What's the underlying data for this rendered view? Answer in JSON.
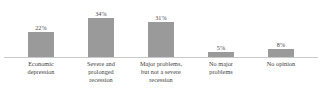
{
  "chart_data": {
    "type": "bar",
    "title": "",
    "subtitle": "",
    "xlabel": "",
    "ylabel": "",
    "ylim": [
      0,
      40
    ],
    "grid": false,
    "legend": false,
    "orientation": "vertical",
    "value_suffix": "%",
    "bar_color": "#9a9a9a",
    "axis_color": "#c9c9c9",
    "label_color": "#3c3c3c",
    "value_label_color": "#4a4a4a",
    "background_color": "#ffffff",
    "categories": [
      "Economic depression",
      "Severe and prolonged recession",
      "Major problems, but not a severe recession",
      "No major problems",
      "No opinion"
    ],
    "category_lines": [
      [
        "Economic",
        "depression"
      ],
      [
        "Severe and",
        "prolonged",
        "recession"
      ],
      [
        "Major problems,",
        "but not a severe",
        "recession"
      ],
      [
        "No major",
        "problems"
      ],
      [
        "No opinion"
      ]
    ],
    "values": [
      22,
      34,
      31,
      5,
      8
    ],
    "value_labels": [
      "22%",
      "34%",
      "31%",
      "5%",
      "8%"
    ],
    "bars": [
      {
        "category": "Economic depression",
        "value": 22,
        "label": "22%"
      },
      {
        "category": "Severe and prolonged recession",
        "value": 34,
        "label": "34%"
      },
      {
        "category": "Major problems, but not a severe recession",
        "value": 31,
        "label": "31%"
      },
      {
        "category": "No major problems",
        "value": 5,
        "label": "5%"
      },
      {
        "category": "No opinion",
        "value": 8,
        "label": "8%"
      }
    ]
  }
}
